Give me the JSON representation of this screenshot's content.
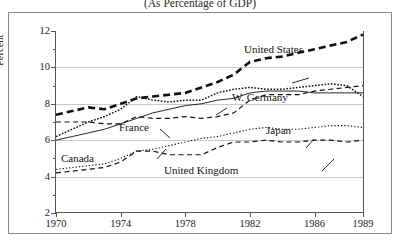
{
  "chart": {
    "title": "(As Percentage of GDP)",
    "ylabel": "Percent",
    "xlabel": ""
  },
  "axis": {
    "y_major": [
      "12",
      "10",
      "8",
      "6",
      "4",
      "2"
    ],
    "x_ticks": [
      "1970",
      "1974",
      "1978",
      "1982",
      "1986",
      "1989"
    ]
  },
  "annotations": {
    "united_states": "United States",
    "w_germany": "W. Germany",
    "france": "France",
    "japan": "Japan",
    "canada": "Canada",
    "united_kingdom": "United Kingdom"
  },
  "chart_data": {
    "type": "line",
    "title": "(As Percentage of GDP)",
    "xlabel": "",
    "ylabel": "Percent",
    "xlim": [
      1970,
      1989
    ],
    "ylim": [
      2,
      12
    ],
    "ytick_major": [
      2,
      4,
      6,
      8,
      10,
      12
    ],
    "ytick_minor": [
      3,
      5,
      7,
      9,
      11
    ],
    "xtick": [
      1970,
      1974,
      1978,
      1982,
      1986,
      1989
    ],
    "grid": "horizontal-major",
    "legend": "inline-annotations",
    "x": [
      1970,
      1971,
      1972,
      1973,
      1974,
      1975,
      1976,
      1977,
      1978,
      1979,
      1980,
      1981,
      1982,
      1983,
      1984,
      1985,
      1986,
      1987,
      1988,
      1989
    ],
    "series": [
      {
        "name": "United States",
        "style": "thick-dashed",
        "values": [
          7.4,
          7.6,
          7.8,
          7.7,
          8.0,
          8.3,
          8.4,
          8.5,
          8.6,
          8.9,
          9.2,
          9.6,
          10.3,
          10.5,
          10.6,
          10.8,
          11.0,
          11.2,
          11.4,
          11.8
        ]
      },
      {
        "name": "W. Germany",
        "style": "dotted",
        "values": [
          6.2,
          6.6,
          7.0,
          7.3,
          7.7,
          8.4,
          8.2,
          8.1,
          8.2,
          8.2,
          8.6,
          8.8,
          8.9,
          8.8,
          8.8,
          8.9,
          9.0,
          9.1,
          9.0,
          8.4
        ]
      },
      {
        "name": "France",
        "style": "solid",
        "values": [
          6.0,
          6.2,
          6.4,
          6.6,
          6.9,
          7.2,
          7.5,
          7.7,
          7.9,
          8.0,
          8.2,
          8.3,
          8.6,
          8.7,
          8.7,
          8.7,
          8.6,
          8.6,
          8.6,
          8.6
        ]
      },
      {
        "name": "Japan",
        "style": "fine-dotted",
        "values": [
          4.4,
          4.5,
          4.6,
          4.7,
          5.0,
          5.4,
          5.5,
          5.7,
          5.9,
          6.1,
          6.2,
          6.4,
          6.6,
          6.7,
          6.6,
          6.6,
          6.7,
          6.8,
          6.8,
          6.7
        ]
      },
      {
        "name": "Canada",
        "style": "dashed",
        "values": [
          7.0,
          7.0,
          7.0,
          6.9,
          6.9,
          7.3,
          7.2,
          7.2,
          7.3,
          7.2,
          7.3,
          7.5,
          8.2,
          8.5,
          8.5,
          8.5,
          8.7,
          8.8,
          8.9,
          9.0
        ]
      },
      {
        "name": "United Kingdom",
        "style": "dashed",
        "values": [
          4.2,
          4.3,
          4.4,
          4.5,
          4.8,
          5.4,
          5.4,
          5.2,
          5.2,
          5.2,
          5.6,
          5.9,
          5.9,
          6.0,
          5.9,
          5.9,
          6.0,
          6.0,
          5.9,
          6.0
        ]
      }
    ]
  }
}
